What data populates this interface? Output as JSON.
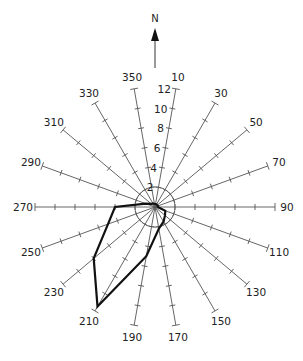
{
  "diagram": {
    "title": "",
    "north_label": "N",
    "center": [
      155,
      207
    ],
    "px_per_unit": 10,
    "max_radius": 12,
    "tick_step": 2,
    "inner_circle_radius": 2,
    "radial_scale_labels": [
      "2",
      "4",
      "6",
      "8",
      "10",
      "12"
    ],
    "colors": {
      "axis": "#555555",
      "polygon": "#111111",
      "text": "#222222"
    }
  },
  "chart_data": {
    "type": "rose",
    "title": "",
    "directions": [
      10,
      30,
      50,
      70,
      90,
      110,
      130,
      150,
      170,
      190,
      210,
      230,
      250,
      270,
      290,
      310,
      330,
      350
    ],
    "values": [
      0.3,
      0.3,
      0.3,
      0.3,
      0.3,
      1.1,
      1.3,
      1.7,
      2.2,
      5,
      11.5,
      8,
      5,
      4,
      1,
      0.5,
      0.4,
      0.3
    ],
    "rlim": [
      0,
      12
    ],
    "r_ticks": [
      2,
      4,
      6,
      8,
      10,
      12
    ],
    "axis_labels": [
      "10",
      "30",
      "50",
      "70",
      "90",
      "110",
      "130",
      "150",
      "170",
      "190",
      "210",
      "230",
      "250",
      "270",
      "290",
      "310",
      "330",
      "350"
    ],
    "annotation": "N (north arrow)"
  }
}
